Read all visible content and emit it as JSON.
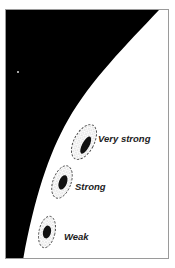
{
  "figure": {
    "colors": {
      "space": "#000000",
      "surface": "#ffffff",
      "frame_border": "#9a9a9a",
      "core": "#111111",
      "halo_stipple": "#bbbbbb",
      "label": "#222222"
    },
    "features": [
      {
        "id": "very-strong",
        "label": "Very strong"
      },
      {
        "id": "strong",
        "label": "Strong"
      },
      {
        "id": "weak",
        "label": "Weak"
      }
    ]
  }
}
